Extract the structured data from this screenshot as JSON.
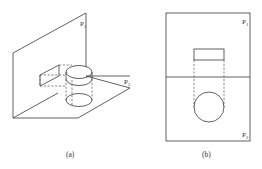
{
  "figure": {
    "panels": [
      {
        "id": "a",
        "caption": "(a)",
        "view": "isometric",
        "planes": [
          {
            "name": "P",
            "subscript": "1",
            "orientation": "vertical"
          },
          {
            "name": "P",
            "subscript": "2",
            "orientation": "horizontal"
          }
        ],
        "object": "cylinder with projected rectangle on P1 and ellipse on P2"
      },
      {
        "id": "b",
        "caption": "(b)",
        "view": "orthographic",
        "planes": [
          {
            "name": "P",
            "subscript": "1",
            "position": "top"
          },
          {
            "name": "P",
            "subscript": "2",
            "position": "bottom"
          }
        ],
        "shapes": [
          "rectangle (projection on P1)",
          "circle (projection on P2)"
        ]
      }
    ],
    "colors": {
      "stroke": "#3a3a3a",
      "background": "#ffffff"
    }
  }
}
